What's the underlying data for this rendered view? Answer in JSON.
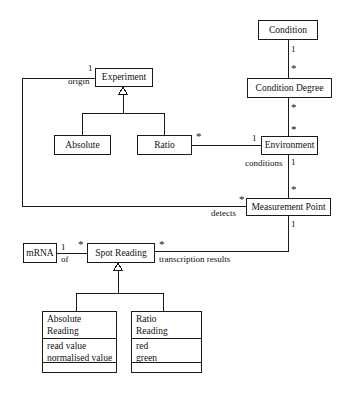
{
  "diagram": {
    "kind": "uml-class-diagram",
    "width": 349,
    "height": 395,
    "background": "#ffffff",
    "line_color": "#1a1a1a",
    "text_color": "#111111"
  },
  "classes": {
    "condition": {
      "name": "Condition"
    },
    "condition_degree": {
      "name": "Condition Degree"
    },
    "environment": {
      "name": "Environment"
    },
    "measurement_point": {
      "name": "Measurement Point"
    },
    "experiment": {
      "name": "Experiment"
    },
    "absolute": {
      "name": "Absolute"
    },
    "ratio": {
      "name": "Ratio"
    },
    "mrna": {
      "name": "mRNA"
    },
    "spot_reading": {
      "name": "Spot Reading"
    },
    "absolute_reading": {
      "name_line1": "Absolute",
      "name_line2": "Reading",
      "attr1": "read value",
      "attr2": "normalised value",
      "operations": ""
    },
    "ratio_reading": {
      "name_line1": "Ratio",
      "name_line2": "Reading",
      "attr1": "red",
      "attr2": "green",
      "operations": ""
    }
  },
  "multiplicities": {
    "condition_to_degree_src": "1",
    "condition_to_degree_tgt": "*",
    "degree_to_environment_src": "*",
    "degree_to_environment_tgt": "*",
    "environment_to_mp_src": "1",
    "environment_to_mp_tgt": "*",
    "mp_to_spot_src": "1",
    "ratio_to_environment_src": "*",
    "ratio_to_environment_tgt": "1",
    "experiment_origin_mult": "1",
    "detects_mult": "*",
    "mrna_mult": "1",
    "spot_reading_left_mult": "*",
    "spot_reading_right_mult": "*"
  },
  "role_labels": {
    "origin": "origin",
    "conditions": "conditions",
    "detects": "detects",
    "of": "of",
    "transcription_results": "transcription results"
  }
}
